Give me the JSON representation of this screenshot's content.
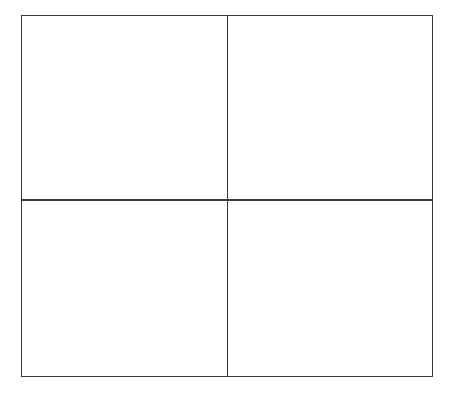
{
  "page": {
    "title": "",
    "background_color": "#ffffff",
    "width": 456,
    "height": 395
  },
  "grid": {
    "type": "2x2-matrix",
    "line_color": "#3b3b3d",
    "line_width_px": 1.6,
    "fill_color": "#ffffff",
    "frame": {
      "left": 21,
      "top": 15,
      "right": 433,
      "bottom": 377,
      "width": 412,
      "height": 362
    },
    "dividers": {
      "vertical_x": 227,
      "horizontal_y": 199
    },
    "rows": 2,
    "columns": 2,
    "cells": [
      {
        "id": "top-left",
        "label": ""
      },
      {
        "id": "top-right",
        "label": ""
      },
      {
        "id": "bottom-left",
        "label": ""
      },
      {
        "id": "bottom-right",
        "label": ""
      }
    ]
  }
}
